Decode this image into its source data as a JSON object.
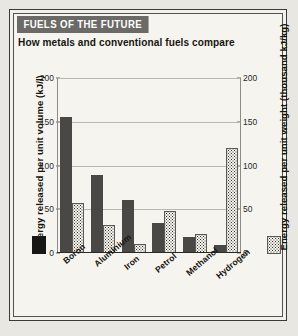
{
  "banner": {
    "title": "FUELS OF THE FUTURE"
  },
  "subtitle": "How metals and conventional fuels compare",
  "chart_data": {
    "type": "bar",
    "title": "FUELS OF THE FUTURE",
    "subtitle": "How metals and conventional fuels compare",
    "categories": [
      "Boron",
      "Aluminium",
      "Iron",
      "Petrol",
      "Methanol",
      "Hydrogen"
    ],
    "series": [
      {
        "name": "Energy released per unit volume (kJ/l)",
        "axis": "left",
        "style": "solid",
        "color": "#4a4845",
        "values": [
          155,
          89,
          61,
          34,
          18,
          9
        ]
      },
      {
        "name": "Energy released per unit weight (thousand kJ/kg)",
        "axis": "right",
        "style": "dotted",
        "color": "#2f2e2b",
        "values": [
          57,
          32,
          10,
          48,
          22,
          120
        ]
      }
    ],
    "ylabel": "Energy released per unit volume (kJ/l)",
    "y2label": "Energy released per unit weight (thousand kJ/kg)",
    "xlabel": "",
    "ylim": [
      0,
      200
    ],
    "y2lim": [
      0,
      200
    ],
    "yticks": [
      0,
      50,
      100,
      150,
      200
    ],
    "y2ticks": [
      0,
      50,
      100,
      150,
      200
    ],
    "grid": true,
    "legend_position": "bottom-outside"
  },
  "axes": {
    "left_title": "Energy released per unit volume (kJ/l)",
    "right_title": "Energy released per unit weight (thousand kJ/kg)",
    "ticks": [
      "200",
      "150",
      "100",
      "50",
      "0"
    ]
  },
  "legend": {
    "solid_name": "solid-swatch",
    "dotted_name": "dotted-swatch"
  }
}
